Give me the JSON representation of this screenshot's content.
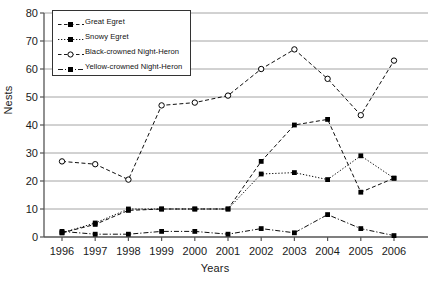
{
  "chart_data": {
    "type": "line",
    "title": "",
    "xlabel": "Years",
    "ylabel": "Nests",
    "categories": [
      "1996",
      "1997",
      "1998",
      "1999",
      "2000",
      "2001",
      "2002",
      "2003",
      "2004",
      "2005",
      "2006"
    ],
    "x": [
      1996,
      1997,
      1998,
      1999,
      2000,
      2001,
      2002,
      2003,
      2004,
      2005,
      2006
    ],
    "xlim": [
      1996,
      2006
    ],
    "ylim": [
      0,
      80
    ],
    "yticks": [
      0,
      10,
      20,
      30,
      40,
      50,
      60,
      70,
      80
    ],
    "grid": true,
    "grid_axis": "y",
    "legend_position": "upper left inside",
    "series": [
      {
        "name": "Great Egret",
        "marker": "filled-square",
        "linestyle": "dashed",
        "color": "#000000",
        "values": [
          1.5,
          4.5,
          9.5,
          10,
          10,
          10,
          27,
          40,
          42,
          16,
          21
        ]
      },
      {
        "name": "Snowy Egret",
        "marker": "filled-square",
        "linestyle": "dotted",
        "color": "#000000",
        "values": [
          1.5,
          5,
          10,
          10,
          10,
          10,
          22.5,
          23,
          20.5,
          29,
          21
        ]
      },
      {
        "name": "Black-crowned Night-Heron",
        "marker": "open-circle",
        "linestyle": "dashed",
        "color": "#000000",
        "values": [
          27,
          26,
          20.5,
          47,
          48,
          50.5,
          60,
          67,
          56.5,
          43.5,
          63
        ]
      },
      {
        "name": "Yellow-crowned Night-Heron",
        "marker": "filled-square",
        "linestyle": "dash-dot",
        "color": "#000000",
        "values": [
          2,
          1,
          1,
          2,
          2,
          1,
          3,
          1.5,
          8,
          3,
          0.5
        ]
      }
    ]
  },
  "axis": {
    "ylabel": "Nests",
    "xlabel": "Years",
    "ytick_labels": [
      "80",
      "70",
      "60",
      "50",
      "40",
      "30",
      "20",
      "10",
      "0"
    ],
    "xtick_labels": [
      "1996",
      "1997",
      "1998",
      "1999",
      "2000",
      "2001",
      "2002",
      "2003",
      "2004",
      "2005",
      "2006"
    ]
  },
  "legend": {
    "items": [
      {
        "label": "Great Egret"
      },
      {
        "label": "Snowy Egret"
      },
      {
        "label": "Black-crowned Night-Heron"
      },
      {
        "label": "Yellow-crowned Night-Heron"
      }
    ]
  },
  "colors": {
    "ink": "#000000",
    "grid": "#9a9a9a",
    "axis": "#555555",
    "background": "#ffffff"
  }
}
